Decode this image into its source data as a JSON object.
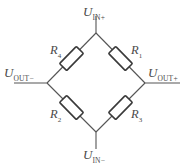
{
  "diagram": {
    "type": "schematic",
    "stroke_color": "#555555",
    "text_color": "#4a4a4a",
    "background": "#ffffff",
    "nodes": {
      "top": {
        "label_main": "U",
        "label_sub": "IN+",
        "x": 96,
        "y": 33
      },
      "bottom": {
        "label_main": "U",
        "label_sub": "IN−",
        "x": 96,
        "y": 132
      },
      "left": {
        "label_main": "U",
        "label_sub": "OUT−",
        "x": 47,
        "y": 83
      },
      "right": {
        "label_main": "U",
        "label_sub": "OUT+",
        "x": 145,
        "y": 83
      }
    },
    "resistors": [
      {
        "name": "r4",
        "label_main": "R",
        "label_sub": "4",
        "branch": "top-left"
      },
      {
        "name": "r1",
        "label_main": "R",
        "label_sub": "1",
        "branch": "top-right"
      },
      {
        "name": "r2",
        "label_main": "R",
        "label_sub": "2",
        "branch": "bottom-left"
      },
      {
        "name": "r3",
        "label_main": "R",
        "label_sub": "3",
        "branch": "bottom-right"
      }
    ]
  }
}
